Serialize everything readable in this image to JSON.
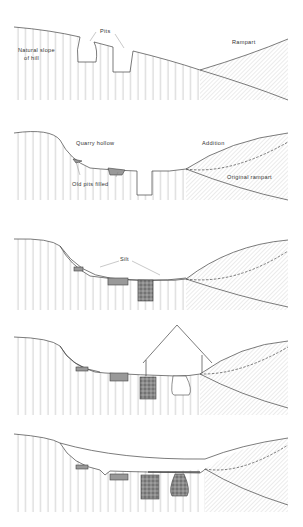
{
  "figure": {
    "panels": [
      {
        "id": 1,
        "labels": {
          "natural_slope_line1": "Natural slope",
          "natural_slope_line2": "of hill",
          "pits": "Pits",
          "rampart": "Rampart"
        }
      },
      {
        "id": 2,
        "labels": {
          "quarry_hollow": "Quarry hollow",
          "addition": "Addition",
          "old_pits_filled": "Old pits filled",
          "original_rampart": "Original rampart"
        }
      },
      {
        "id": 3,
        "labels": {
          "silt": "Silt"
        }
      },
      {
        "id": 4,
        "labels": {}
      },
      {
        "id": 5,
        "labels": {}
      }
    ]
  },
  "colors": {
    "line": "#444444",
    "hatch": "#777777",
    "fill": "#999999",
    "background": "#ffffff"
  }
}
